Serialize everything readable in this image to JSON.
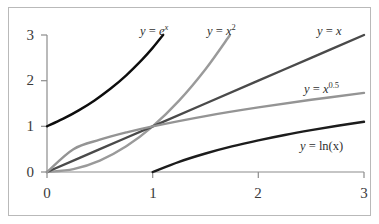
{
  "chart_data": {
    "type": "line",
    "title": "",
    "xlabel": "",
    "ylabel": "",
    "xlim": [
      0,
      3
    ],
    "ylim": [
      0,
      3
    ],
    "xticks": [
      "0",
      "1",
      "2",
      "3"
    ],
    "yticks": [
      "0",
      "1",
      "2",
      "3"
    ],
    "grid": false,
    "legend": "inline-annotations",
    "series": [
      {
        "name": "y = e^x",
        "label_prefix": "y",
        "label_eq": " = ",
        "label_base": "e",
        "label_exponent": "x",
        "color": "#0d0d0d",
        "x": [
          0,
          0.15,
          0.3,
          0.45,
          0.6,
          0.75,
          0.9,
          1.0,
          1.1
        ],
        "y": [
          1,
          1.162,
          1.35,
          1.568,
          1.822,
          2.117,
          2.46,
          2.718,
          3.004
        ]
      },
      {
        "name": "y = x^2",
        "label_prefix": "y",
        "label_eq": " = ",
        "label_base": "x",
        "label_exponent": "2",
        "color": "#9a9a9a",
        "x": [
          0,
          0.25,
          0.5,
          0.75,
          1.0,
          1.25,
          1.5,
          1.73
        ],
        "y": [
          0,
          0.0625,
          0.25,
          0.5625,
          1.0,
          1.5625,
          2.25,
          2.993
        ]
      },
      {
        "name": "y = x",
        "label_prefix": "y",
        "label_eq": " = ",
        "label_base": "x",
        "label_exponent": "",
        "color": "#4a4a4a",
        "x": [
          0,
          0.5,
          1.0,
          1.5,
          2.0,
          2.5,
          3.0
        ],
        "y": [
          0,
          0.5,
          1.0,
          1.5,
          2.0,
          2.5,
          3.0
        ]
      },
      {
        "name": "y = x^0.5",
        "label_prefix": "y",
        "label_eq": " = ",
        "label_base": "x",
        "label_exponent": "0.5",
        "color": "#949494",
        "x": [
          0,
          0.25,
          0.5,
          0.75,
          1.0,
          1.5,
          2.0,
          2.5,
          3.0
        ],
        "y": [
          0,
          0.5,
          0.707,
          0.866,
          1.0,
          1.225,
          1.414,
          1.581,
          1.732
        ]
      },
      {
        "name": "y = ln(x)",
        "label_prefix": "y",
        "label_eq": " = ",
        "label_base": "ln(x)",
        "label_exponent": "",
        "color": "#1c1c1c",
        "x": [
          1.0,
          1.25,
          1.5,
          1.75,
          2.0,
          2.25,
          2.5,
          2.75,
          3.0
        ],
        "y": [
          0,
          0.223,
          0.405,
          0.56,
          0.693,
          0.811,
          0.916,
          1.012,
          1.099
        ]
      }
    ],
    "axis_color": "#8c8c8c",
    "border_color": "#b9b9b9",
    "background_color": "#ffffff"
  },
  "labels": {
    "exp": {
      "prefix": "y",
      "eq": " = ",
      "base": "e",
      "sup": "x"
    },
    "square": {
      "prefix": "y",
      "eq": " = ",
      "base": "x",
      "sup": "2"
    },
    "linear": {
      "prefix": "y",
      "eq": " = ",
      "base": "x",
      "sup": ""
    },
    "sqrt": {
      "prefix": "y",
      "eq": " = ",
      "base": "x",
      "sup": "0.5"
    },
    "log": {
      "prefix": "y",
      "eq": " = ",
      "base": "ln(x)",
      "sup": ""
    }
  },
  "axes": {
    "y_ticks": [
      {
        "value": "3"
      },
      {
        "value": "2"
      },
      {
        "value": "1"
      },
      {
        "value": "0"
      }
    ],
    "x_ticks": [
      {
        "value": "0"
      },
      {
        "value": "1"
      },
      {
        "value": "2"
      },
      {
        "value": "3"
      }
    ]
  }
}
